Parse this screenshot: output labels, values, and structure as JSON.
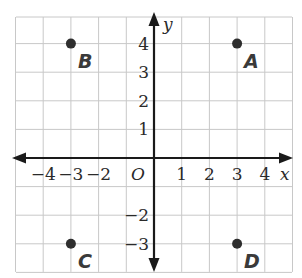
{
  "diagram": {
    "type": "coordinate-plane",
    "x_axis": {
      "name": "x",
      "min": -4,
      "max": 4,
      "tick_labels": [
        {
          "value": -4,
          "label": "−4"
        },
        {
          "value": -3,
          "label": "−3"
        },
        {
          "value": -2,
          "label": "−2"
        },
        {
          "value": 1,
          "label": "1"
        },
        {
          "value": 2,
          "label": "2"
        },
        {
          "value": 3,
          "label": "3"
        },
        {
          "value": 4,
          "label": "4"
        }
      ]
    },
    "y_axis": {
      "name": "y",
      "min": -3,
      "max": 4,
      "tick_labels": [
        {
          "value": 4,
          "label": "4"
        },
        {
          "value": 3,
          "label": "3"
        },
        {
          "value": 2,
          "label": "2"
        },
        {
          "value": 1,
          "label": "1"
        },
        {
          "value": -2,
          "label": "−2"
        },
        {
          "value": -3,
          "label": "−3"
        }
      ]
    },
    "origin_label": "O",
    "grid": {
      "x_from": -5,
      "x_to": 5,
      "y_from": -4,
      "y_to": 5
    },
    "points": [
      {
        "name": "A",
        "x": 3,
        "y": 4
      },
      {
        "name": "B",
        "x": -3,
        "y": 4
      },
      {
        "name": "C",
        "x": -3,
        "y": -3
      },
      {
        "name": "D",
        "x": 3,
        "y": -3
      }
    ],
    "colors": {
      "grid": "#c8c8c8",
      "axis": "#1a1a1a",
      "point": "#2e2e2e",
      "label": "#3a3a3a"
    }
  }
}
